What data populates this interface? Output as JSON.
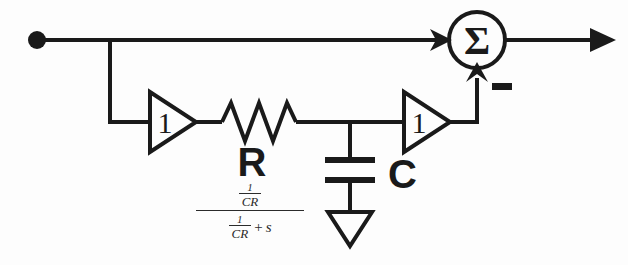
{
  "diagram": {
    "type": "circuit-block-diagram",
    "background_color": "#fdfdfd",
    "line_color": "#1a1a1a",
    "nodes": {
      "input_node": {
        "name": "input-node-dot",
        "shape": "filled-circle"
      },
      "summing_junction": {
        "name": "summing-junction",
        "symbol": "Σ",
        "shape": "circle"
      },
      "output_arrow": {
        "name": "output-arrow",
        "shape": "arrowhead-right"
      },
      "ground": {
        "name": "ground-symbol",
        "shape": "hollow-triangle-down"
      }
    },
    "components": [
      {
        "name": "buffer-amplifier-left",
        "symbol": "triangle",
        "gain_label": "1"
      },
      {
        "name": "resistor",
        "symbol": "zigzag",
        "label": "R"
      },
      {
        "name": "capacitor",
        "symbol": "parallel-plates",
        "label": "C"
      },
      {
        "name": "buffer-amplifier-right",
        "symbol": "triangle",
        "gain_label": "1"
      }
    ],
    "labels": {
      "resistor": "R",
      "capacitor": "C",
      "gain_left": "1",
      "gain_right": "1",
      "summation": "Σ",
      "feedback_sign": "−"
    },
    "transfer_function": {
      "name": "transfer-function-expression",
      "plain_text": "(1/CR) / ((1/CR) + s)",
      "numerator": {
        "num": "1",
        "den": "CR"
      },
      "denominator": {
        "frac_num": "1",
        "frac_den": "CR",
        "operator": "+",
        "term": "s"
      }
    }
  }
}
